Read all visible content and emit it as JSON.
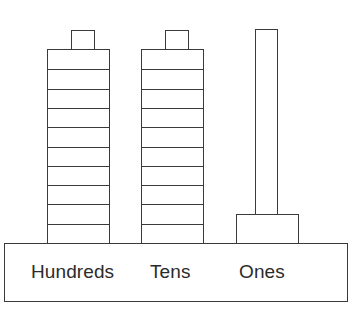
{
  "figure": {
    "stroke_color": "#3a3a3a",
    "fill_color": "#ffffff",
    "text_color": "#2b2b2b"
  },
  "base": {
    "label_hundreds": "Hundreds",
    "label_tens": "Tens",
    "label_ones": "Ones"
  },
  "columns": [
    {
      "place": "hundreds",
      "label": "Hundreds",
      "kind": "segmented-stack",
      "segments": 10,
      "has_cap": true,
      "cap_label": ""
    },
    {
      "place": "tens",
      "label": "Tens",
      "kind": "segmented-stack",
      "segments": 10,
      "has_cap": true,
      "cap_label": ""
    },
    {
      "place": "ones",
      "label": "Ones",
      "kind": "post-with-footing",
      "segments": 1,
      "has_cap": false,
      "cap_label": ""
    }
  ],
  "chart_data": {
    "type": "bar",
    "categories": [
      "Hundreds",
      "Tens",
      "Ones"
    ],
    "values": [
      10,
      10,
      1
    ],
    "series": [
      {
        "name": "Block segments",
        "values": [
          10,
          10,
          1
        ]
      }
    ],
    "xlabel": "",
    "ylabel": "",
    "ylim": [
      0,
      11
    ],
    "grid": false,
    "legend": "none",
    "annotations": [
      "Hundreds column: tall segmented stack of 10 units topped by a small cap block",
      "Tens column: tall segmented stack of 10 units topped by a small cap block",
      "Ones column: single narrow tall post resting on a wide short footing block"
    ]
  }
}
